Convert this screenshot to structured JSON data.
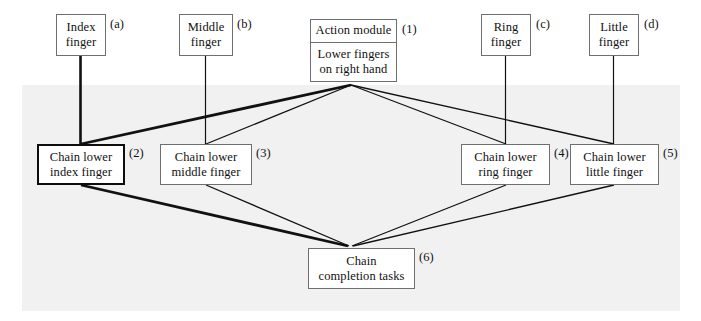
{
  "diagram": {
    "panel_color": "#f1f1f2",
    "line_color": "#111111",
    "highlight_color": "#0d0d0d",
    "nodes": {
      "index_finger": {
        "tag": "(a)",
        "lines": [
          "Index",
          "finger"
        ]
      },
      "middle_finger": {
        "tag": "(b)",
        "lines": [
          "Middle",
          "finger"
        ]
      },
      "ring_finger": {
        "tag": "(c)",
        "lines": [
          "Ring",
          "finger"
        ]
      },
      "little_finger": {
        "tag": "(d)",
        "lines": [
          "Little",
          "finger"
        ]
      },
      "action_module": {
        "tag": "(1)",
        "header": "Action module",
        "body": [
          "Lower fingers",
          "on right hand"
        ]
      },
      "chain_index": {
        "tag": "(2)",
        "lines": [
          "Chain lower",
          "index finger"
        ]
      },
      "chain_middle": {
        "tag": "(3)",
        "lines": [
          "Chain  lower",
          "middle finger"
        ]
      },
      "chain_ring": {
        "tag": "(4)",
        "lines": [
          "Chain  lower",
          "ring finger"
        ]
      },
      "chain_little": {
        "tag": "(5)",
        "lines": [
          "Chain  lower",
          "little finger"
        ]
      },
      "chain_completion": {
        "tag": "(6)",
        "lines": [
          "Chain",
          "completion tasks"
        ]
      }
    }
  }
}
